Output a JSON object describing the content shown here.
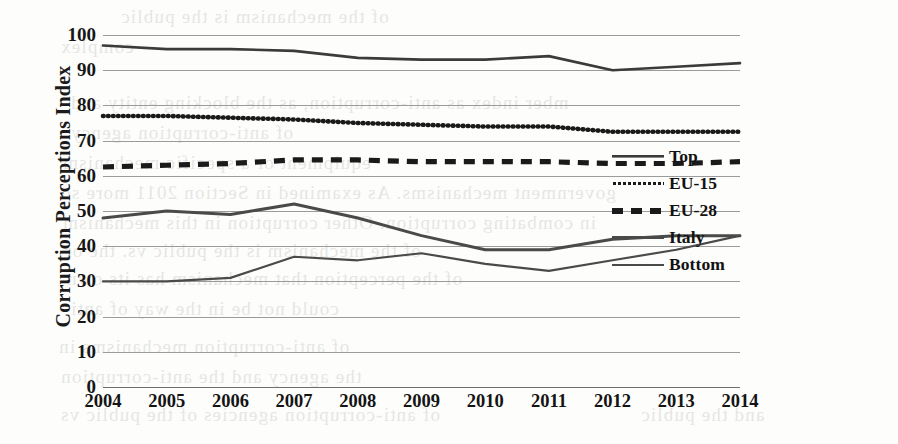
{
  "chart_data": {
    "type": "line",
    "title": "",
    "xlabel": "",
    "ylabel": "Corruption Perceptions Index",
    "categories": [
      "2004",
      "2005",
      "2006",
      "2007",
      "2008",
      "2009",
      "2010",
      "2011",
      "2012",
      "2013",
      "2014"
    ],
    "ylim": [
      0,
      100
    ],
    "yticks": [
      0,
      10,
      20,
      30,
      40,
      50,
      60,
      70,
      80,
      90,
      100
    ],
    "grid": true,
    "legend_position": "right-inside",
    "series": [
      {
        "name": "Top",
        "style": "solid",
        "color": "#3b3b3b",
        "values": [
          97,
          96,
          96,
          95.5,
          93.5,
          93,
          93,
          94,
          90,
          91,
          92
        ]
      },
      {
        "name": "EU-15",
        "style": "dotted",
        "color": "#1a1a1a",
        "values": [
          77,
          77,
          76.5,
          76,
          75,
          74.5,
          74,
          74,
          72.5,
          72.5,
          72.5
        ]
      },
      {
        "name": "EU-28",
        "style": "dashed",
        "color": "#1a1a1a",
        "values": [
          62.5,
          63,
          63.5,
          64.5,
          64.5,
          64,
          64,
          64,
          63.5,
          63.5,
          64
        ]
      },
      {
        "name": "Italy",
        "style": "solid-thick",
        "color": "#4a4a4a",
        "values": [
          48,
          50,
          49,
          52,
          48,
          43,
          39,
          39,
          42,
          43,
          43
        ]
      },
      {
        "name": "Bottom",
        "style": "solid-thin",
        "color": "#4a4a4a",
        "values": [
          30,
          30,
          31,
          37,
          36,
          38,
          35,
          33,
          36,
          39,
          43
        ]
      }
    ]
  },
  "legend": {
    "items": [
      {
        "label": "Top",
        "swatch": "solid-line-swatch"
      },
      {
        "label": "EU-15",
        "swatch": "dotted-line-swatch"
      },
      {
        "label": "EU-28",
        "swatch": "dashed-line-swatch"
      },
      {
        "label": "Italy",
        "swatch": "thick-line-swatch"
      },
      {
        "label": "Bottom",
        "swatch": "thin-line-swatch"
      }
    ]
  },
  "bleed_text": [
    {
      "text": "of the mechanism is the public",
      "x": 120,
      "y": 6
    },
    {
      "text": "complex",
      "x": 60,
      "y": 36
    },
    {
      "text": "mber index as anti-corruption, as the blocking entity and",
      "x": 70,
      "y": 92
    },
    {
      "text": "of anti-corruption agency",
      "x": 70,
      "y": 122
    },
    {
      "text": "equipment or a specific mechanism",
      "x": 62,
      "y": 152
    },
    {
      "text": "government mechanisms. As examined in Section 2011 more so",
      "x": 60,
      "y": 182
    },
    {
      "text": "in combating corruption. Other corruption in this mechanism",
      "x": 62,
      "y": 212
    },
    {
      "text": "of the mechanism is the public vs. the or",
      "x": 64,
      "y": 240
    },
    {
      "text": "of the perception that mechanism has its own",
      "x": 66,
      "y": 268
    },
    {
      "text": "could not be in the way of anti",
      "x": 70,
      "y": 298
    },
    {
      "text": "of anti-corruption mechanisms in",
      "x": 58,
      "y": 336
    },
    {
      "text": "the agency and the anti-corruption",
      "x": 60,
      "y": 366
    },
    {
      "text": "of anti-corruption agencies of the public vs",
      "x": 60,
      "y": 404
    },
    {
      "text": "and the public",
      "x": 640,
      "y": 404
    }
  ]
}
